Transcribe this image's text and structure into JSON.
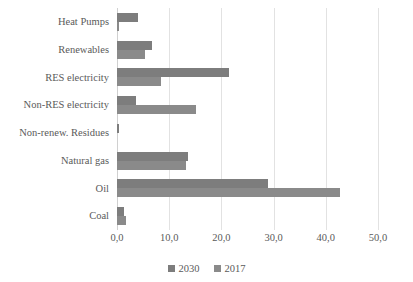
{
  "chart_data": {
    "type": "bar",
    "orientation": "horizontal",
    "title": "",
    "xlabel": "",
    "ylabel": "",
    "xlim": [
      0,
      50
    ],
    "xticks": [
      0,
      10,
      20,
      30,
      40,
      50
    ],
    "xtick_labels": [
      "0,0",
      "10,0",
      "20,0",
      "30,0",
      "40,0",
      "50,0"
    ],
    "grid": true,
    "legend_position": "bottom",
    "categories": [
      "Heat Pumps",
      "Renewables",
      "RES electricity",
      "Non-RES electricity",
      "Non-renew. Residues",
      "Natural gas",
      "Oil",
      "Coal"
    ],
    "series": [
      {
        "name": "2030",
        "color": "#7d7d7d",
        "values": [
          4.0,
          6.8,
          21.4,
          3.6,
          0.3,
          13.6,
          29.0,
          1.3
        ]
      },
      {
        "name": "2017",
        "color": "#8a8a8a",
        "values": [
          0.4,
          5.4,
          8.4,
          15.2,
          0.0,
          13.3,
          42.7,
          1.7
        ]
      }
    ]
  },
  "legend": {
    "items": [
      {
        "label": "2030"
      },
      {
        "label": "2017"
      }
    ]
  }
}
